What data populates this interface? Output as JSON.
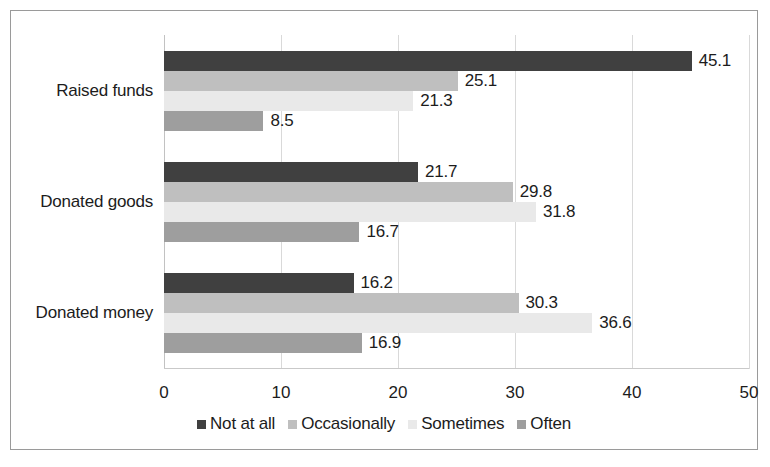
{
  "chart_data": {
    "type": "bar",
    "orientation": "horizontal",
    "title": "",
    "xlabel": "",
    "ylabel": "",
    "xlim": [
      0,
      50
    ],
    "xticks": [
      0,
      10,
      20,
      30,
      40,
      50
    ],
    "xtick_labels": [
      "0",
      "10",
      "20",
      "30",
      "40",
      "50"
    ],
    "grid": true,
    "grid_axis": "x",
    "legend_position": "bottom",
    "categories": [
      "Raised funds",
      "Donated goods",
      "Donated money"
    ],
    "series": [
      {
        "name": "Not at all",
        "color": "#404040",
        "values": [
          45.1,
          21.7,
          16.2
        ],
        "labels": [
          "45.1",
          "21.7",
          "16.2"
        ]
      },
      {
        "name": "Occasionally",
        "color": "#bfbfbf",
        "values": [
          25.1,
          29.8,
          30.3
        ],
        "labels": [
          "25.1",
          "29.8",
          "30.3"
        ]
      },
      {
        "name": "Sometimes",
        "color": "#e9e9e9",
        "values": [
          21.3,
          31.8,
          36.6
        ],
        "labels": [
          "21.3",
          "31.8",
          "36.6"
        ]
      },
      {
        "name": "Often",
        "color": "#9e9e9e",
        "values": [
          8.5,
          16.7,
          16.9
        ],
        "labels": [
          "8.5",
          "16.7",
          "16.9"
        ]
      }
    ]
  },
  "legend": {
    "items": [
      {
        "label": "Not at all",
        "color": "#404040"
      },
      {
        "label": "Occasionally",
        "color": "#bfbfbf"
      },
      {
        "label": "Sometimes",
        "color": "#e9e9e9"
      },
      {
        "label": "Often",
        "color": "#9e9e9e"
      }
    ]
  }
}
